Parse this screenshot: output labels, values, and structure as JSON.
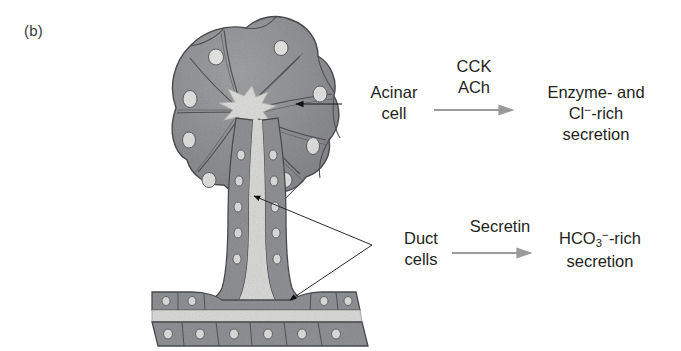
{
  "figure": {
    "panel_label": "(b)",
    "domain": "biology-diagram"
  },
  "labels": {
    "acinar_cell": "Acinar\ncell",
    "acinar_cell_line1": "Acinar",
    "acinar_cell_line2": "cell",
    "duct_cells_line1": "Duct",
    "duct_cells_line2": "cells"
  },
  "stimuli": {
    "top_line1": "CCK",
    "top_line2": "ACh",
    "bottom": "Secretin"
  },
  "outputs": {
    "top_line1": "Enzyme- and",
    "top_line2_prefix": "Cl",
    "top_line2_charge": "−",
    "top_line2_suffix": "-rich",
    "top_line3": "secretion",
    "bottom_formula": "HCO",
    "bottom_subscript": "3",
    "bottom_charge": "−",
    "bottom_suffix": "-rich",
    "bottom_line2": "secretion"
  },
  "icons": {
    "acinar_pointer": "arrow-left-icon",
    "duct_pointer": "forked-arrow-icon",
    "reaction_arrow_top": "arrow-right-icon",
    "reaction_arrow_bottom": "arrow-right-icon"
  },
  "colors": {
    "cell_fill": "#8f9194",
    "cell_fill_light": "#9b9da0",
    "cell_outline": "#4d4f52",
    "lumen": "#d8d9d6",
    "nucleus": "#e3e4e2",
    "text": "#231f20",
    "reaction_arrow": "#9a9a9a",
    "pointer": "#1a1a1a",
    "background": "#ffffff"
  },
  "anatomy": {
    "acinus_label": "acinus",
    "lobule_count": 9,
    "central_lumen": "star-shaped acinar lumen",
    "intercalated_duct": "vertical duct with cuboidal epithelium",
    "collecting_duct": "horizontal collecting duct"
  }
}
